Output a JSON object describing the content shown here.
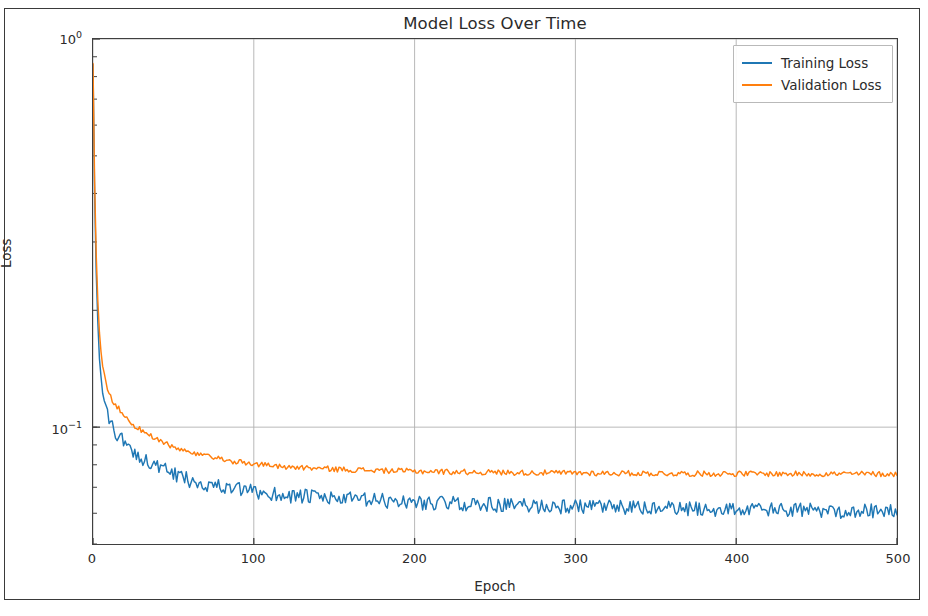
{
  "chart_data": {
    "type": "line",
    "title": "Model Loss Over Time",
    "xlabel": "Epoch",
    "ylabel": "Loss",
    "yscale": "log",
    "xscale": "linear",
    "xlim": [
      0,
      500
    ],
    "ylim": [
      0.05,
      1.0
    ],
    "xticks": [
      0,
      100,
      200,
      300,
      400,
      500
    ],
    "xtick_labels": [
      "0",
      "100",
      "200",
      "300",
      "400",
      "500"
    ],
    "yticks": [
      0.1,
      1.0
    ],
    "ytick_labels": [
      "10⁻¹",
      "10⁰"
    ],
    "ytick_mantissa": [
      "10",
      "10"
    ],
    "ytick_exponent": [
      "-1",
      "0"
    ],
    "grid": true,
    "grid_axis": "both",
    "grid_color": "#b0b0b0",
    "legend_position": "upper right",
    "series": [
      {
        "name": "Training Loss",
        "color": "#1f77b4",
        "start_value": 0.86,
        "plateau_value": 0.061,
        "final_value": 0.06,
        "decay_epochs": 22,
        "noise": 0.0026,
        "x": [
          0,
          1,
          2,
          3,
          4,
          5,
          6,
          8,
          10,
          12,
          15,
          20,
          25,
          30,
          40,
          50,
          60,
          70,
          80,
          90,
          100,
          120,
          140,
          160,
          180,
          200,
          225,
          250,
          275,
          300,
          325,
          350,
          375,
          400,
          425,
          450,
          475,
          500
        ],
        "y": [
          0.86,
          0.402,
          0.252,
          0.186,
          0.152,
          0.133,
          0.122,
          0.111,
          0.1045,
          0.1005,
          0.096,
          0.0905,
          0.0866,
          0.0838,
          0.079,
          0.0756,
          0.0732,
          0.0715,
          0.0701,
          0.069,
          0.0681,
          0.0668,
          0.0659,
          0.0652,
          0.0646,
          0.0641,
          0.0636,
          0.0631,
          0.0627,
          0.0624,
          0.0621,
          0.0618,
          0.0616,
          0.0614,
          0.0612,
          0.061,
          0.0609,
          0.0607
        ]
      },
      {
        "name": "Validation Loss",
        "color": "#ff7f0e",
        "start_value": 0.865,
        "plateau_value": 0.0762,
        "final_value": 0.0758,
        "decay_epochs": 26,
        "noise": 0.0012,
        "x": [
          0,
          1,
          2,
          3,
          4,
          5,
          6,
          8,
          10,
          12,
          15,
          20,
          25,
          30,
          40,
          50,
          60,
          70,
          80,
          90,
          100,
          120,
          140,
          160,
          180,
          200,
          225,
          250,
          275,
          300,
          325,
          350,
          375,
          400,
          425,
          450,
          475,
          500
        ],
        "y": [
          0.865,
          0.43,
          0.278,
          0.212,
          0.176,
          0.156,
          0.144,
          0.13,
          0.1225,
          0.1178,
          0.1128,
          0.1062,
          0.1016,
          0.0982,
          0.0926,
          0.0887,
          0.0859,
          0.084,
          0.0825,
          0.0813,
          0.0804,
          0.0791,
          0.0783,
          0.0777,
          0.0773,
          0.077,
          0.0767,
          0.0765,
          0.0763,
          0.0762,
          0.0761,
          0.076,
          0.0759,
          0.0759,
          0.0758,
          0.0758,
          0.0758,
          0.0757
        ]
      }
    ]
  },
  "legend": {
    "items": [
      {
        "label": "Training Loss"
      },
      {
        "label": "Validation Loss"
      }
    ]
  }
}
